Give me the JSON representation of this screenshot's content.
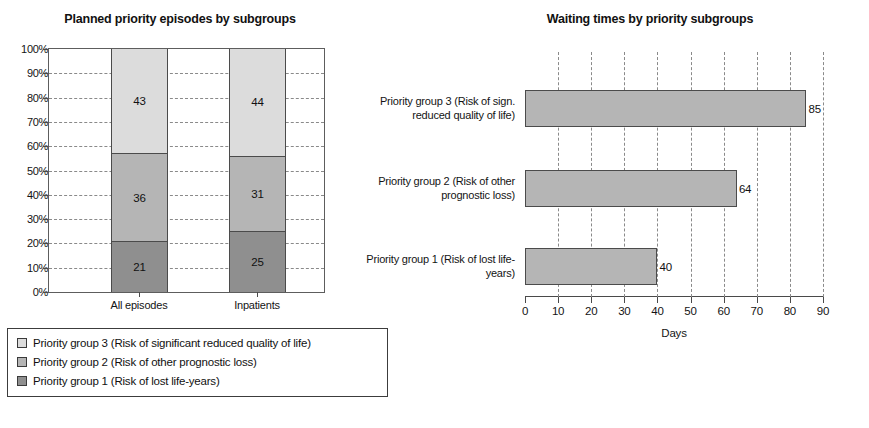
{
  "chart_data": [
    {
      "type": "bar",
      "subtype": "stacked-column-100pct",
      "title": "Planned priority episodes by subgroups",
      "xlabel": "",
      "ylabel": "",
      "ylim": [
        0,
        100
      ],
      "ytick_labels": [
        "100%",
        "90%",
        "80%",
        "70%",
        "60%",
        "50%",
        "40%",
        "30%",
        "20%",
        "10%",
        "0%"
      ],
      "grid": true,
      "categories": [
        "All episodes",
        "Inpatients"
      ],
      "series": [
        {
          "name": "Priority group 1 (Risk of lost life-years)",
          "values": [
            21,
            25
          ],
          "color": "#8f8f8f"
        },
        {
          "name": "Priority group 2 (Risk of other prognostic loss)",
          "values": [
            36,
            31
          ],
          "color": "#b5b5b5"
        },
        {
          "name": "Priority group 3 (Risk of significant reduced quality of life)",
          "values": [
            43,
            44
          ],
          "color": "#dcdcdc"
        }
      ],
      "legend_position": "below",
      "legend": [
        "Priority group 3 (Risk of significant reduced quality of life)",
        "Priority group 2 (Risk of other prognostic loss)",
        "Priority group 1 (Risk of lost life-years)"
      ]
    },
    {
      "type": "bar",
      "subtype": "horizontal",
      "title": "Waiting times by priority subgroups",
      "xlabel": "Days",
      "ylabel": "",
      "xlim": [
        0,
        90
      ],
      "xtick_labels": [
        "0",
        "10",
        "20",
        "30",
        "40",
        "50",
        "60",
        "70",
        "80",
        "90"
      ],
      "grid": true,
      "categories": [
        "Priority group 3 (Risk of sign. reduced quality of life)",
        "Priority group 2 (Risk of other prognostic loss)",
        "Priority group 1 (Risk of lost life-years)"
      ],
      "values": [
        85,
        64,
        40
      ],
      "bar_color": "#b5b5b5"
    }
  ],
  "left_chart": {
    "title": "Planned priority episodes by subgroups",
    "y_ticks": [
      "100%",
      "90%",
      "80%",
      "70%",
      "60%",
      "50%",
      "40%",
      "30%",
      "20%",
      "10%",
      "0%"
    ],
    "columns": [
      {
        "category": "All episodes",
        "segments": [
          {
            "label": "43",
            "value": 43,
            "group": "Priority group 3"
          },
          {
            "label": "36",
            "value": 36,
            "group": "Priority group 2"
          },
          {
            "label": "21",
            "value": 21,
            "group": "Priority group 1"
          }
        ]
      },
      {
        "category": "Inpatients",
        "segments": [
          {
            "label": "44",
            "value": 44,
            "group": "Priority group 3"
          },
          {
            "label": "31",
            "value": 31,
            "group": "Priority group 2"
          },
          {
            "label": "25",
            "value": 25,
            "group": "Priority group 1"
          }
        ]
      }
    ],
    "legend": [
      {
        "label": "Priority group 3 (Risk of significant reduced quality of life)",
        "color": "#dcdcdc"
      },
      {
        "label": "Priority group 2 (Risk of other prognostic loss)",
        "color": "#b5b5b5"
      },
      {
        "label": "Priority group 1 (Risk of lost life-years)",
        "color": "#8f8f8f"
      }
    ]
  },
  "right_chart": {
    "title": "Waiting times by priority subgroups",
    "axis_title": "Days",
    "x_ticks": [
      "0",
      "10",
      "20",
      "30",
      "40",
      "50",
      "60",
      "70",
      "80",
      "90"
    ],
    "bars": [
      {
        "category": "Priority group 3 (Risk of sign. reduced quality of life)",
        "value": 85,
        "label": "85"
      },
      {
        "category": "Priority group 2 (Risk of other prognostic loss)",
        "value": 64,
        "label": "64"
      },
      {
        "category": "Priority group 1 (Risk of lost life-years)",
        "value": 40,
        "label": "40"
      }
    ]
  },
  "colors": {
    "group1": "#8f8f8f",
    "group2": "#b5b5b5",
    "group3": "#dcdcdc",
    "axis": "#4a4a4a",
    "grid": "#8a8a8a",
    "text": "#141414"
  }
}
